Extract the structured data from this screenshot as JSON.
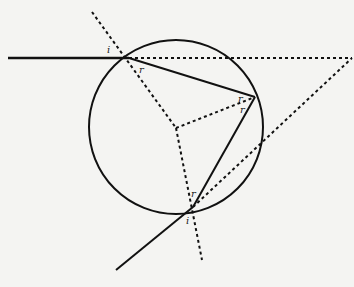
{
  "diagram": {
    "circle": {
      "cx": 176,
      "cy": 127,
      "r": 87
    },
    "points": {
      "entry": [
        129,
        58
      ],
      "reflection": [
        255,
        97
      ],
      "exit": [
        193,
        207
      ],
      "center": [
        176,
        128
      ],
      "apex": [
        352,
        58
      ]
    },
    "labels": {
      "entry_incident": "i",
      "entry_refracted": "r",
      "reflect_in": "r",
      "reflect_out": "r",
      "exit_refracted": "r",
      "exit_incident": "i"
    },
    "colors": {
      "ink": "#111111",
      "background": "#f4f4f2"
    }
  }
}
